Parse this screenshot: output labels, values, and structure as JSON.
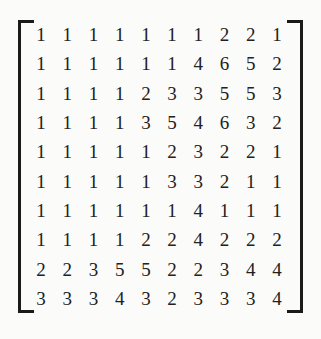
{
  "figure": {
    "kind": "matrix",
    "rows": 10,
    "cols": 10,
    "left_bracket": "[",
    "right_bracket": "]",
    "text_color": "#212121",
    "bracket_color": "#1a1a1a",
    "background_color": "#fbfbfa"
  },
  "chart_data": {
    "type": "table",
    "title": "",
    "xlabel": "",
    "ylabel": "",
    "values": [
      [
        1,
        1,
        1,
        1,
        1,
        1,
        1,
        2,
        2,
        1
      ],
      [
        1,
        1,
        1,
        1,
        1,
        1,
        4,
        6,
        5,
        2
      ],
      [
        1,
        1,
        1,
        1,
        2,
        3,
        3,
        5,
        5,
        3
      ],
      [
        1,
        1,
        1,
        1,
        3,
        5,
        4,
        6,
        3,
        2
      ],
      [
        1,
        1,
        1,
        1,
        1,
        2,
        3,
        2,
        2,
        1
      ],
      [
        1,
        1,
        1,
        1,
        1,
        3,
        3,
        2,
        1,
        1
      ],
      [
        1,
        1,
        1,
        1,
        1,
        1,
        4,
        1,
        1,
        1
      ],
      [
        1,
        1,
        1,
        1,
        2,
        2,
        4,
        2,
        2,
        2
      ],
      [
        2,
        2,
        3,
        5,
        5,
        2,
        2,
        3,
        4,
        4
      ],
      [
        3,
        3,
        3,
        4,
        3,
        2,
        3,
        3,
        3,
        4
      ]
    ]
  }
}
